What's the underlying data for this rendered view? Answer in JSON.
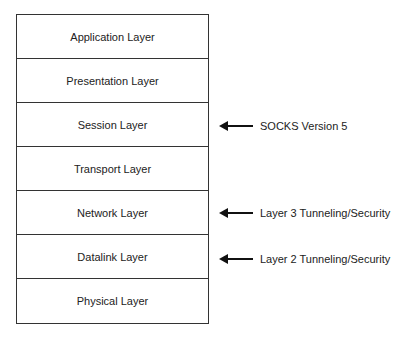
{
  "diagram": {
    "layers": [
      {
        "label": "Application Layer"
      },
      {
        "label": "Presentation Layer"
      },
      {
        "label": "Session Layer"
      },
      {
        "label": "Transport Layer"
      },
      {
        "label": "Network Layer"
      },
      {
        "label": "Datalink Layer"
      },
      {
        "label": "Physical Layer"
      }
    ],
    "annotations": [
      {
        "target": "Session Layer",
        "label": "SOCKS Version 5"
      },
      {
        "target": "Network Layer",
        "label": "Layer 3 Tunneling/Security"
      },
      {
        "target": "Datalink Layer",
        "label": "Layer 2 Tunneling/Security"
      }
    ],
    "colors": {
      "line": "#333333",
      "text": "#222222",
      "background": "#ffffff"
    }
  }
}
